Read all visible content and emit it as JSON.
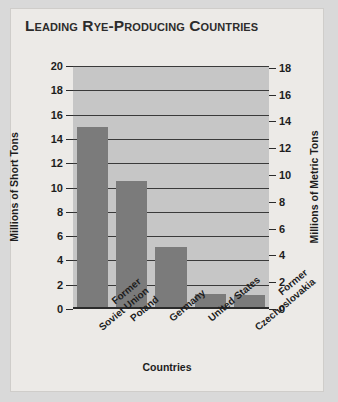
{
  "title": "Leading Rye-Producing Countries",
  "chart_data": {
    "type": "bar",
    "title": "Leading Rye-Producing Countries",
    "xlabel": "Countries",
    "ylabel": "Millions of Short Tons",
    "ylabel_right": "Millions of Metric Tons",
    "categories": [
      "Former\nSoviet Union",
      "Poland",
      "Germany",
      "United States",
      "Former\nCzechoslovakia"
    ],
    "values": [
      14.8,
      10.4,
      4.9,
      1.1,
      1.0
    ],
    "ylim": [
      0,
      20
    ],
    "yticks": [
      0,
      2,
      4,
      6,
      8,
      10,
      12,
      14,
      16,
      18,
      20
    ],
    "ylim_right": [
      0,
      18.14
    ],
    "yticks_right": [
      0,
      2,
      4,
      6,
      8,
      10,
      12,
      14,
      16,
      18
    ],
    "grid": true,
    "legend": false,
    "bar_color": "#7b7b7b",
    "plot_background": "#c6c6c6",
    "gridline_color": "#3a3a3a",
    "axis_color": "#2b2b2b"
  }
}
